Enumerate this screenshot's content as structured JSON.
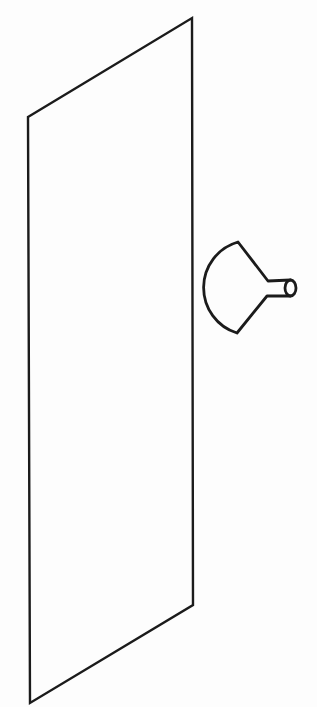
{
  "canvas": {
    "width": 317,
    "height": 707,
    "background": "#fdfdfd"
  },
  "figure": {
    "stroke_color": "#1b1b1b",
    "panel": {
      "points": "28,117 192,18 193,605 30,703",
      "stroke_width": 2.4
    },
    "funnel": {
      "body_path": "M 290.5 280 L 268 281 L 238 242 A 47.5 47.5 0 0 0 237 333 L 267 296 L 290.5 296",
      "stroke_width": 2.8,
      "spout_ellipse": {
        "cx": 290.5,
        "cy": 288,
        "rx": 5.5,
        "ry": 8
      }
    }
  }
}
